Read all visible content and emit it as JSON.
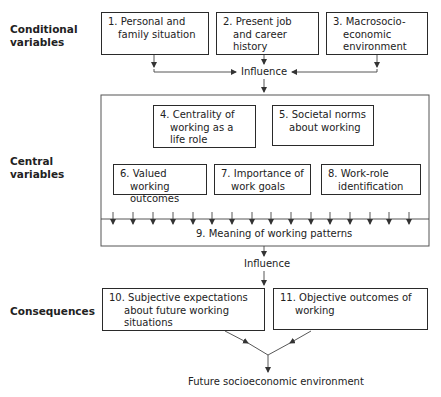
{
  "categories": {
    "conditional": "Conditional\nvariables",
    "central": "Central\nvariables",
    "consequences": "Consequences"
  },
  "conditional_boxes": [
    {
      "number": "1.",
      "text": "Personal and family situation"
    },
    {
      "number": "2.",
      "text": "Present job and career history"
    },
    {
      "number": "3.",
      "text": "Macrosocio- economic environment"
    }
  ],
  "influence_labels": [
    "Influence",
    "Influence"
  ],
  "central_boxes": [
    {
      "number": "4.",
      "text": "Centrality of working as a life role"
    },
    {
      "number": "5.",
      "text": "Societal norms about working"
    },
    {
      "number": "6.",
      "text": "Valued working outcomes"
    },
    {
      "number": "7.",
      "text": "Importance of work goals"
    },
    {
      "number": "8.",
      "text": "Work-role identification"
    }
  ],
  "meaning_label": "9. Meaning of working patterns",
  "consequence_boxes": [
    {
      "number": "10.",
      "text": "Subjective expectations about future working situations"
    },
    {
      "number": "11.",
      "text": "Objective outcomes of working"
    }
  ],
  "final_label": "Future socioeconomic environment",
  "pattern_arrow_count": 16
}
